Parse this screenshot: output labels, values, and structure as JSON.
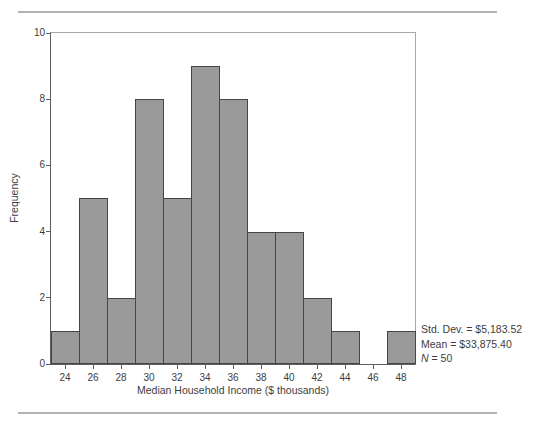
{
  "chart_data": {
    "type": "bar",
    "subtype": "histogram",
    "title": "",
    "categories": [
      "24",
      "26",
      "28",
      "30",
      "32",
      "34",
      "36",
      "38",
      "40",
      "42",
      "44",
      "46",
      "48"
    ],
    "values": [
      1,
      5,
      2,
      8,
      5,
      9,
      8,
      4,
      4,
      2,
      1,
      0,
      1
    ],
    "xlabel": "Median Household Income ($ thousands)",
    "ylabel": "Frequency",
    "ylim": [
      0,
      10
    ],
    "yticks": [
      0,
      2,
      4,
      6,
      8,
      10
    ],
    "grid": "off",
    "legend": "none",
    "bar_fill": "#9a9a9a",
    "bar_border": "#454545",
    "annotations": [
      "Std. Dev. = $5,183.52",
      "Mean = $33,875.40",
      "N = 50"
    ]
  },
  "stats_panel": {
    "std_dev": "Std. Dev. = $5,183.52",
    "mean": "Mean = $33,875.40",
    "n_label": "N",
    "n_rest": " = 50"
  }
}
